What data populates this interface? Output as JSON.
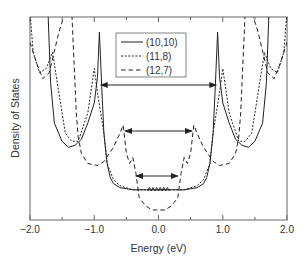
{
  "chart_data": {
    "type": "line",
    "title": "",
    "xlabel": "Energy (eV)",
    "ylabel": "Density of States",
    "xlim": [
      -2.0,
      2.0
    ],
    "ylim": [
      0,
      1
    ],
    "grid": false,
    "legend_position": "upper center",
    "x_ticks": [
      "−2.0",
      "−1.0",
      "0.0",
      "1.0",
      "2.0"
    ],
    "x_tick_values": [
      -2.0,
      -1.0,
      0.0,
      1.0,
      2.0
    ],
    "x_minor_tick_values": [
      -1.5,
      -0.5,
      0.5,
      1.5
    ],
    "y_ticks": [],
    "series": [
      {
        "name": "(10,10)",
        "style": "solid",
        "description": "Metallic nanotube; flat nonzero DOS near Fermi level between van Hove singularities at about ±0.92 eV",
        "x": [
          -2.0,
          -1.72,
          -1.68,
          -1.62,
          -1.5,
          -1.4,
          -1.3,
          -1.2,
          -1.1,
          -1.0,
          -0.95,
          -0.92,
          -0.88,
          -0.85,
          -0.8,
          -0.75,
          -0.7,
          -0.6,
          -0.4,
          -0.2,
          0.0,
          0.2,
          0.4,
          0.6,
          0.7,
          0.75,
          0.8,
          0.85,
          0.88,
          0.92,
          0.95,
          1.0,
          1.1,
          1.2,
          1.3,
          1.4,
          1.5,
          1.62,
          1.68,
          1.72,
          2.0
        ],
        "y": [
          1.0,
          1.0,
          0.65,
          0.45,
          0.36,
          0.33,
          0.34,
          0.37,
          0.45,
          0.55,
          0.68,
          0.9,
          0.6,
          0.4,
          0.25,
          0.18,
          0.15,
          0.13,
          0.12,
          0.12,
          0.12,
          0.12,
          0.12,
          0.13,
          0.15,
          0.18,
          0.25,
          0.4,
          0.6,
          0.9,
          0.68,
          0.55,
          0.45,
          0.37,
          0.34,
          0.33,
          0.36,
          0.45,
          0.65,
          1.0,
          1.0
        ]
      },
      {
        "name": "(11,8)",
        "style": "dotted",
        "description": "Semiconducting tube; van Hove singularities near ±0.55 eV and ±1.0 eV",
        "x": [
          -2.0,
          -1.95,
          -1.85,
          -1.75,
          -1.65,
          -1.55,
          -1.45,
          -1.35,
          -1.25,
          -1.1,
          -1.0,
          -0.95,
          -0.9,
          -0.85,
          -0.8,
          -0.7,
          -0.6,
          -0.4,
          -0.2,
          0.0,
          0.2,
          0.4,
          0.6,
          0.7,
          0.8,
          0.85,
          0.9,
          0.95,
          1.0,
          1.1,
          1.25,
          1.35,
          1.45,
          1.55,
          1.65,
          1.75,
          1.85,
          1.95,
          2.0
        ],
        "y": [
          1.0,
          0.8,
          0.7,
          0.72,
          0.8,
          0.6,
          0.4,
          0.36,
          0.36,
          0.5,
          0.72,
          0.6,
          0.5,
          0.4,
          0.25,
          0.17,
          0.14,
          0.12,
          0.12,
          0.12,
          0.12,
          0.12,
          0.14,
          0.17,
          0.25,
          0.4,
          0.5,
          0.6,
          0.72,
          0.5,
          0.36,
          0.36,
          0.4,
          0.6,
          0.8,
          0.72,
          0.7,
          0.8,
          1.0
        ]
      },
      {
        "name": "(12,7)",
        "style": "dashed",
        "description": "Semiconducting tube; zero DOS near ±0.3 eV gap, singularities near ±0.55 eV and ±1.3 eV",
        "x": [
          -2.0,
          -1.9,
          -1.8,
          -1.7,
          -1.55,
          -1.45,
          -1.35,
          -1.28,
          -1.25,
          -1.2,
          -1.1,
          -0.95,
          -0.85,
          -0.7,
          -0.6,
          -0.55,
          -0.5,
          -0.45,
          -0.4,
          -0.35,
          -0.3,
          -0.2,
          -0.1,
          0.0,
          0.1,
          0.2,
          0.3,
          0.35,
          0.4,
          0.45,
          0.5,
          0.55,
          0.6,
          0.7,
          0.85,
          0.95,
          1.1,
          1.2,
          1.25,
          1.28,
          1.35,
          1.45,
          1.55,
          1.7,
          1.8,
          1.9,
          2.0
        ],
        "y": [
          0.85,
          0.75,
          0.67,
          0.7,
          0.9,
          1.0,
          1.0,
          0.5,
          0.38,
          0.3,
          0.25,
          0.24,
          0.26,
          0.33,
          0.4,
          0.44,
          0.3,
          0.25,
          0.28,
          0.2,
          0.08,
          0.04,
          0.02,
          0.02,
          0.02,
          0.04,
          0.08,
          0.2,
          0.28,
          0.25,
          0.3,
          0.44,
          0.4,
          0.33,
          0.26,
          0.24,
          0.25,
          0.3,
          0.38,
          0.5,
          1.0,
          1.0,
          0.9,
          0.7,
          0.67,
          0.75,
          0.85
        ]
      }
    ],
    "annotations": [
      {
        "type": "double-arrow",
        "x_from": -0.9,
        "x_to": 0.9,
        "y": 0.66,
        "label": ""
      },
      {
        "type": "double-arrow",
        "x_from": -0.52,
        "x_to": 0.52,
        "y": 0.44,
        "label": ""
      },
      {
        "type": "double-arrow",
        "x_from": -0.35,
        "x_to": 0.3,
        "y": 0.22,
        "label": ""
      }
    ]
  },
  "axes": {
    "xlabel": "Energy (eV)",
    "ylabel": "Density of States",
    "x_ticks": [
      "−2.0",
      "−1.0",
      "0.0",
      "1.0",
      "2.0"
    ]
  },
  "legend": {
    "items": [
      {
        "label": "(10,10)",
        "style": "solid"
      },
      {
        "label": "(11,8)",
        "style": "dotted"
      },
      {
        "label": "(12,7)",
        "style": "dashed"
      }
    ]
  },
  "colors": {
    "line": "#222222",
    "frame": "#555555",
    "text": "#333333",
    "background": "#ffffff"
  }
}
